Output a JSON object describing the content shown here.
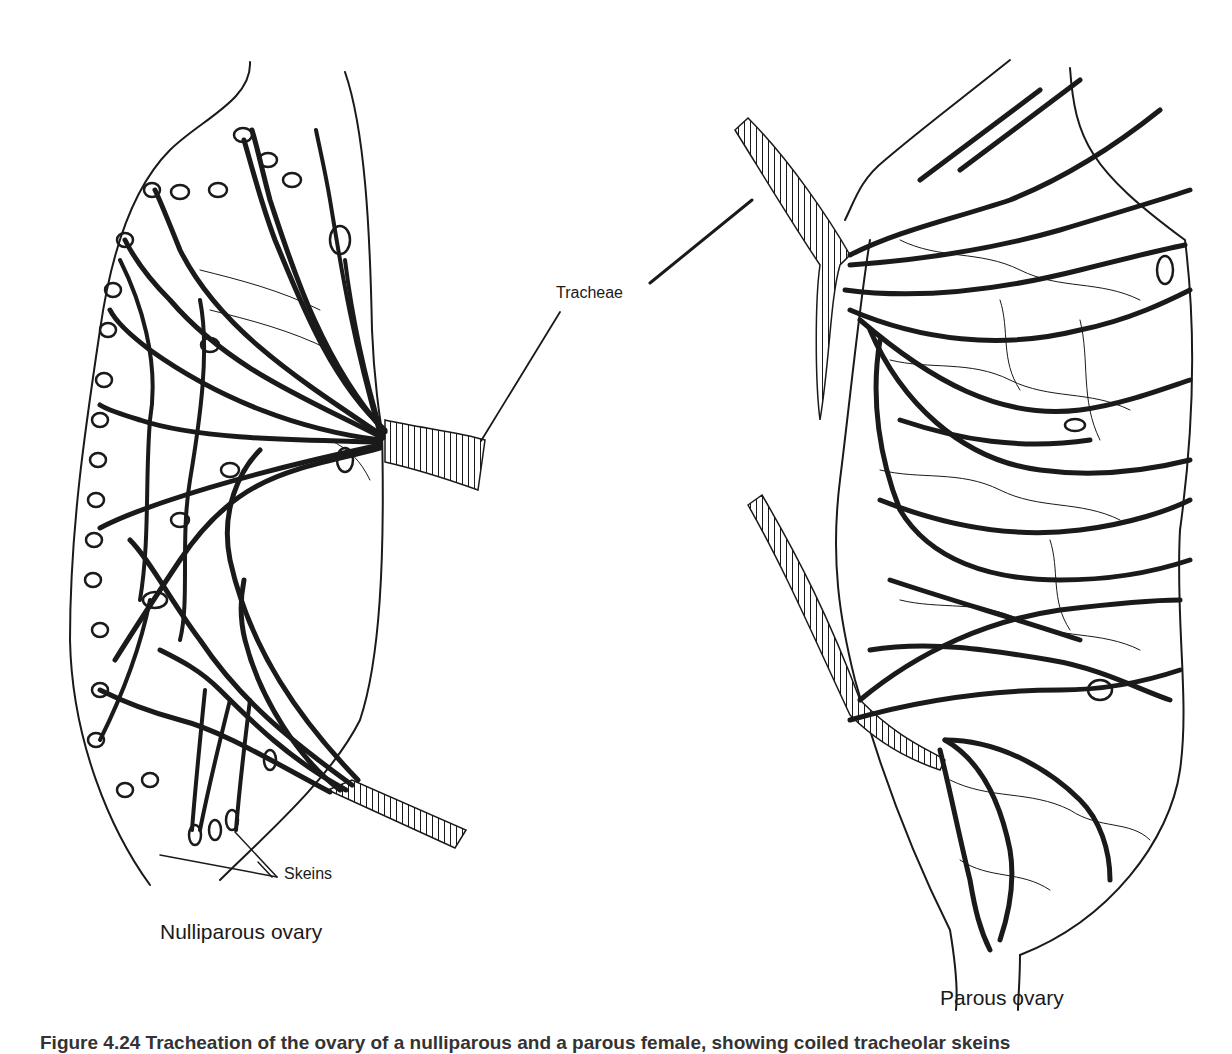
{
  "figure": {
    "labels": {
      "tracheae": "Tracheae",
      "skeins": "Skeins",
      "left_panel": "Nulliparous ovary",
      "right_panel": "Parous ovary"
    },
    "caption": "Figure 4.24  Tracheation of the ovary of a nulliparous and a parous female, showing coiled tracheolar skeins"
  },
  "colors": {
    "ink": "#1a1a1a",
    "background": "#ffffff"
  }
}
